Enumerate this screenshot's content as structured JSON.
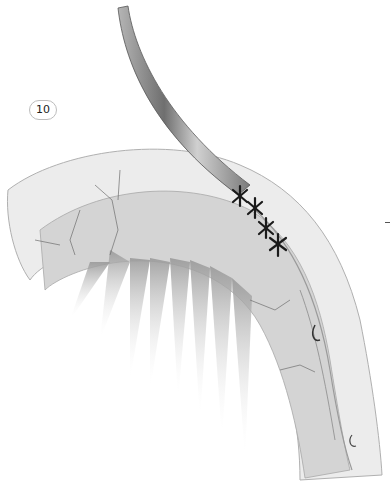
{
  "figure": {
    "panel_label": "10",
    "elements": {
      "tube": "catheter-tube",
      "sutures_count": 4,
      "organ": "curved-tubular-organ-with-mesentery"
    },
    "colors": {
      "background": "#ffffff",
      "organ_fill": "#d9d9d9",
      "tube_fill": "#8a8a8a",
      "suture": "#1a1a1a",
      "vessel_lines": "#6e6e6e"
    }
  }
}
